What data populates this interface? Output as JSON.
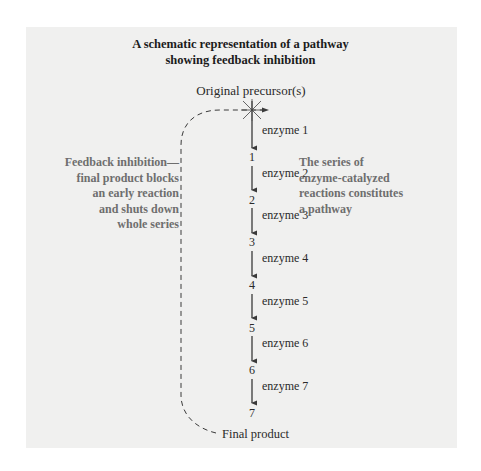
{
  "title": {
    "line1": "A schematic representation of a pathway",
    "line2": "showing feedback inhibition"
  },
  "precursor_label": "Original precursor(s)",
  "steps": [
    {
      "enzyme": "enzyme 1",
      "product": "1"
    },
    {
      "enzyme": "enzyme 2",
      "product": "2"
    },
    {
      "enzyme": "enzyme 3",
      "product": "3"
    },
    {
      "enzyme": "enzyme 4",
      "product": "4"
    },
    {
      "enzyme": "enzyme 5",
      "product": "5"
    },
    {
      "enzyme": "enzyme 6",
      "product": "6"
    },
    {
      "enzyme": "enzyme 7",
      "product": "7"
    }
  ],
  "final_product_label": "Final product",
  "annotations": {
    "feedback": [
      "Feedback inhibition—",
      "final product blocks",
      "an early reaction",
      "and shuts down",
      "whole series"
    ],
    "pathway": [
      "The series of",
      "enzyme-catalyzed",
      "reactions constitutes",
      "a pathway"
    ]
  },
  "colors": {
    "panel": "#f0f0ef",
    "text": "#2a2a2a",
    "annotation": "#6e6e6e",
    "arrow": "#3a3a3a"
  }
}
